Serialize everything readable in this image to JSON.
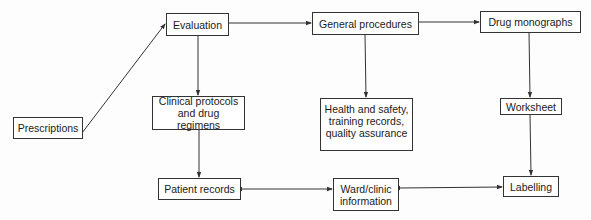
{
  "diagram": {
    "type": "flowchart",
    "nodes": {
      "prescriptions": "Prescriptions",
      "evaluation": "Evaluation",
      "general_procedures": "General procedures",
      "drug_monographs": "Drug monographs",
      "clinical_protocols": "Clinical protocols and drug regimens",
      "health_safety": "Health and safety, training records, quality assurance",
      "worksheet": "Worksheet",
      "patient_records": "Patient records",
      "ward_clinic": "Ward/clinic information",
      "labelling": "Labelling"
    },
    "edges": [
      {
        "from": "Prescriptions",
        "to": "Evaluation",
        "direction": "forward"
      },
      {
        "from": "Evaluation",
        "to": "General procedures",
        "direction": "forward"
      },
      {
        "from": "General procedures",
        "to": "Drug monographs",
        "direction": "forward"
      },
      {
        "from": "Evaluation",
        "to": "Clinical protocols and drug regimens",
        "direction": "forward"
      },
      {
        "from": "General procedures",
        "to": "Health and safety, training records, quality assurance",
        "direction": "forward"
      },
      {
        "from": "Drug monographs",
        "to": "Worksheet",
        "direction": "forward"
      },
      {
        "from": "Clinical protocols and drug regimens",
        "to": "Patient records",
        "direction": "forward"
      },
      {
        "from": "Worksheet",
        "to": "Labelling",
        "direction": "forward"
      },
      {
        "from": "Patient records",
        "to": "Ward/clinic information",
        "direction": "bidirectional"
      },
      {
        "from": "Ward/clinic information",
        "to": "Labelling",
        "direction": "bidirectional"
      }
    ],
    "colors": {
      "line": "#333333",
      "box_border": "#333333",
      "background": "#ffffff"
    }
  }
}
